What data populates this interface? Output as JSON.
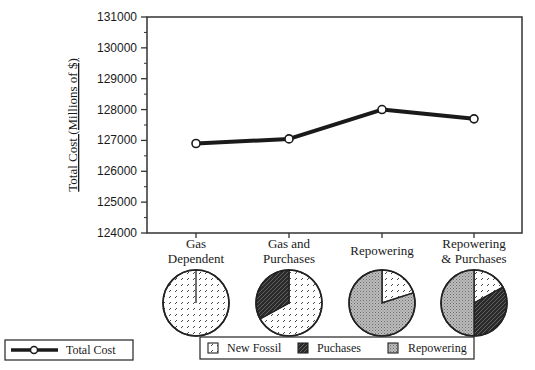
{
  "chart_data": [
    {
      "type": "line",
      "title": "",
      "xlabel": "",
      "ylabel": "Total Cost (Millions of $)",
      "categories": [
        "Gas Dependent",
        "Gas and Purchases",
        "Repowering",
        "Repowering & Purchases"
      ],
      "category_lines": [
        [
          "Gas",
          "Dependent"
        ],
        [
          "Gas and",
          "Purchases"
        ],
        [
          "Repowering"
        ],
        [
          "Repowering",
          "& Purchases"
        ]
      ],
      "series": [
        {
          "name": "Total Cost",
          "values": [
            126900,
            127050,
            128000,
            127700
          ],
          "color": "#1a1a1a",
          "marker": "open-circle"
        }
      ],
      "ylim": [
        124000,
        131000
      ],
      "yticks": [
        124000,
        125000,
        126000,
        127000,
        128000,
        129000,
        130000,
        131000
      ],
      "minor_ticks_per_major": 2,
      "grid": false,
      "legend": {
        "position": "bottom-left",
        "entries": [
          "Total Cost"
        ]
      }
    },
    {
      "type": "pie",
      "title": "Resource mix by scenario",
      "slice_labels": [
        "New Fossil",
        "Puchases",
        "Repowering"
      ],
      "pies": [
        {
          "category": "Gas Dependent",
          "values": [
            100,
            0,
            0
          ]
        },
        {
          "category": "Gas and Purchases",
          "values": [
            67,
            33,
            0
          ]
        },
        {
          "category": "Repowering",
          "values": [
            20,
            0,
            80
          ]
        },
        {
          "category": "Repowering & Purchases",
          "values": [
            17,
            33,
            50
          ]
        }
      ],
      "legend": {
        "position": "bottom-center",
        "entries": [
          "New Fossil",
          "Puchases",
          "Repowering"
        ]
      }
    }
  ],
  "legend_line": {
    "label": "Total Cost"
  },
  "legend_pie": {
    "items": [
      "New Fossil",
      "Puchases",
      "Repowering"
    ]
  }
}
